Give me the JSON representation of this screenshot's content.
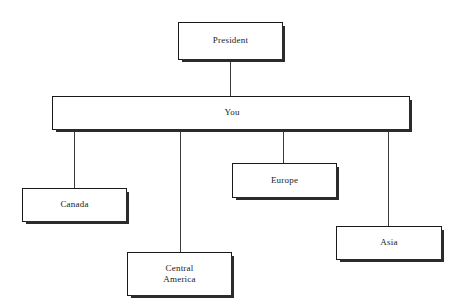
{
  "chart": {
    "type": "org-chart",
    "background_color": "#ffffff",
    "box_border_color": "#1a1a1a",
    "shadow_color": "#2b2b2b",
    "line_color": "#3a3a3a",
    "text_color": "#1a1a1a"
  },
  "nodes": {
    "president": {
      "label": "President",
      "level": 0,
      "x": 178,
      "y": 22,
      "width": 105,
      "height": 38
    },
    "you": {
      "label": "You",
      "level": 1,
      "x": 52,
      "y": 96,
      "width": 358,
      "height": 34
    },
    "canada": {
      "label": "Canada",
      "level": 2,
      "x": 22,
      "y": 188,
      "width": 105,
      "height": 34
    },
    "central_america": {
      "label": "Central\nAmerica",
      "level": 2,
      "x": 127,
      "y": 252,
      "width": 105,
      "height": 44
    },
    "europe": {
      "label": "Europe",
      "level": 2,
      "x": 232,
      "y": 163,
      "width": 105,
      "height": 35
    },
    "asia": {
      "label": "Asia",
      "level": 2,
      "x": 336,
      "y": 226,
      "width": 106,
      "height": 34
    }
  },
  "edges": [
    {
      "from": "president",
      "to": "you",
      "drop_x": 230
    },
    {
      "from": "you",
      "to": "canada",
      "drop_x": 74
    },
    {
      "from": "you",
      "to": "central_america",
      "drop_x": 180
    },
    {
      "from": "you",
      "to": "europe",
      "drop_x": 283
    },
    {
      "from": "you",
      "to": "asia",
      "drop_x": 388
    }
  ]
}
